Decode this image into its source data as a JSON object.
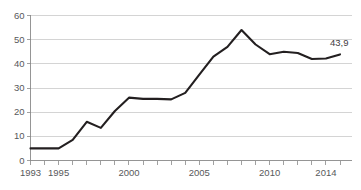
{
  "chart_data": {
    "type": "line",
    "title": "",
    "subtitle": "",
    "xlabel": "",
    "ylabel": "",
    "xlim": [
      1993,
      2015
    ],
    "ylim": [
      0,
      60
    ],
    "grid": true,
    "legend": null,
    "x": [
      1993,
      1994,
      1995,
      1996,
      1997,
      1998,
      1999,
      2000,
      2001,
      2002,
      2003,
      2004,
      2005,
      2006,
      2007,
      2008,
      2009,
      2010,
      2011,
      2012,
      2013,
      2014,
      2015
    ],
    "values": [
      5.0,
      5.0,
      5.0,
      8.5,
      16.0,
      13.5,
      20.5,
      26.0,
      25.5,
      25.5,
      25.3,
      28.0,
      35.5,
      43.0,
      47.0,
      54.0,
      48.0,
      44.0,
      45.0,
      44.5,
      42.0,
      42.2,
      43.9
    ],
    "series": [
      {
        "name": "series-1",
        "color": "#231f20",
        "values": [
          5.0,
          5.0,
          5.0,
          8.5,
          16.0,
          13.5,
          20.5,
          26.0,
          25.5,
          25.5,
          25.3,
          28.0,
          35.5,
          43.0,
          47.0,
          54.0,
          48.0,
          44.0,
          45.0,
          44.5,
          42.0,
          42.2,
          43.9
        ]
      }
    ],
    "ytick_values": [
      0,
      10,
      20,
      30,
      40,
      50,
      60
    ],
    "ytick_labels": [
      "0",
      "10",
      "20",
      "30",
      "40",
      "50",
      "60"
    ],
    "xtick_values": [
      1993,
      1994,
      1995,
      1996,
      1997,
      1998,
      1999,
      2000,
      2001,
      2002,
      2003,
      2004,
      2005,
      2006,
      2007,
      2008,
      2009,
      2010,
      2011,
      2012,
      2013,
      2014,
      2015
    ],
    "xtick_labeled": [
      {
        "value": 1993,
        "label": "1993"
      },
      {
        "value": 1995,
        "label": "1995"
      },
      {
        "value": 2000,
        "label": "2000"
      },
      {
        "value": 2005,
        "label": "2005"
      },
      {
        "value": 2010,
        "label": "2010"
      },
      {
        "value": 2014,
        "label": "2014"
      }
    ],
    "annotations": [
      {
        "text": "43,9",
        "x": 2015,
        "y": 43.9,
        "anchor": "right-of-point"
      }
    ],
    "colors": {
      "line": "#231f20",
      "grid": "#c9c9c9",
      "axis": "#8a8a8a",
      "tick_text": "#58595b",
      "label_text": "#414042",
      "background": "#ffffff"
    }
  }
}
